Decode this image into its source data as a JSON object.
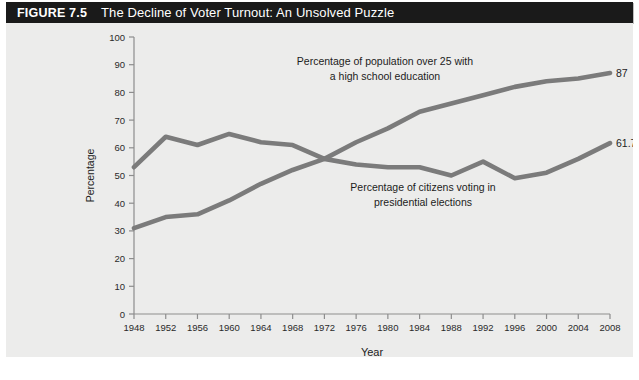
{
  "header": {
    "figure_number": "FIGURE 7.5",
    "title": "The Decline of Voter Turnout: An Unsolved Puzzle"
  },
  "chart_data": {
    "type": "line",
    "title": "The Decline of Voter Turnout: An Unsolved Puzzle",
    "xlabel": "Year",
    "ylabel": "Percentage",
    "xlim": [
      1948,
      2008
    ],
    "ylim": [
      0,
      100
    ],
    "grid": false,
    "legend_position": "inline-annotations",
    "x": [
      1948,
      1952,
      1956,
      1960,
      1964,
      1968,
      1972,
      1976,
      1980,
      1984,
      1988,
      1992,
      1996,
      2000,
      2004,
      2008
    ],
    "xticklabels": [
      "1948",
      "1952",
      "1956",
      "1960",
      "1964",
      "1968",
      "1972",
      "1976",
      "1980",
      "1984",
      "1988",
      "1992",
      "1996",
      "2000",
      "2004",
      "2008"
    ],
    "yticks": [
      0,
      10,
      20,
      30,
      40,
      50,
      60,
      70,
      80,
      90,
      100
    ],
    "yticklabels": [
      "0",
      "10",
      "20",
      "30",
      "40",
      "50",
      "60",
      "70",
      "80",
      "90",
      "100"
    ],
    "series": [
      {
        "name": "Percentage of population over 25 with a high school education",
        "color": "#7b7b7b",
        "values": [
          31,
          35,
          36,
          41,
          47,
          52,
          56,
          62,
          67,
          73,
          76,
          79,
          82,
          84,
          85,
          87
        ],
        "endpoint_label": "87",
        "annotation": "Percentage of population over 25 with\na high school education",
        "annotation_line1": "Percentage of population over 25 with",
        "annotation_line2": "a high school education"
      },
      {
        "name": "Percentage of citizens voting in presidential elections",
        "color": "#7b7b7b",
        "values": [
          53,
          64,
          61,
          65,
          62,
          61,
          56,
          54,
          53,
          53,
          50,
          55,
          49,
          51,
          56,
          61.7
        ],
        "endpoint_label": "61.7",
        "annotation": "Percentage of citizens voting in\npresidential elections",
        "annotation_line1": "Percentage of citizens voting in",
        "annotation_line2": "presidential elections"
      }
    ]
  },
  "footer": {
    "clipped_caption": ""
  }
}
